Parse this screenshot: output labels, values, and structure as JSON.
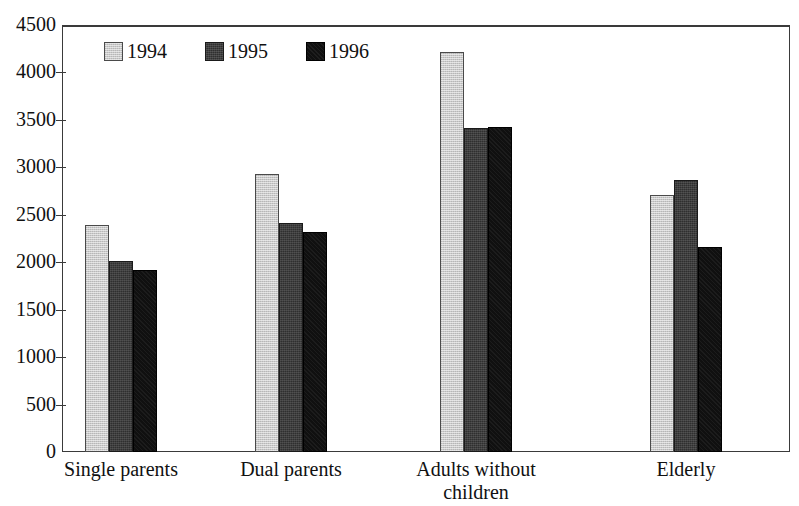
{
  "chart_data": {
    "type": "bar",
    "title": "",
    "xlabel": "",
    "ylabel": "",
    "ylim": [
      0,
      4500
    ],
    "grid": false,
    "legend_position": "top-left-inside",
    "categories": [
      "Single parents",
      "Dual parents",
      "Adults without children",
      "Elderly"
    ],
    "series": [
      {
        "name": "1994",
        "color": "#c9c9c9",
        "values": [
          2390,
          2930,
          4220,
          2710
        ]
      },
      {
        "name": "1995",
        "color": "#2f2f2f",
        "values": [
          2010,
          2410,
          3410,
          2870
        ]
      },
      {
        "name": "1996",
        "color": "#101010",
        "values": [
          1920,
          2320,
          3430,
          2160
        ]
      }
    ],
    "y_ticks": [
      0,
      500,
      1000,
      1500,
      2000,
      2500,
      3000,
      3500,
      4000,
      4500
    ],
    "y_tick_labels": [
      "0",
      "500",
      "1000",
      "1500",
      "2000",
      "2500",
      "3000",
      "3500",
      "4000",
      "4500"
    ]
  },
  "legend": {
    "items": [
      {
        "label": "1994",
        "swatch": "legend-swatch-1994"
      },
      {
        "label": "1995",
        "swatch": "legend-swatch-1995"
      },
      {
        "label": "1996",
        "swatch": "legend-swatch-1996"
      }
    ]
  },
  "x_axis": {
    "labels": [
      {
        "line1": "Single parents",
        "line2": ""
      },
      {
        "line1": "Dual parents",
        "line2": ""
      },
      {
        "line1": "Adults without",
        "line2": "children"
      },
      {
        "line1": "Elderly",
        "line2": ""
      }
    ]
  }
}
